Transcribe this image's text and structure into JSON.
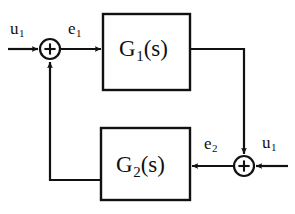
{
  "diagram": {
    "type": "control-block-diagram",
    "colors": {
      "stroke": "#111111",
      "background": "#ffffff",
      "text": "#111111"
    },
    "blocks": [
      {
        "id": "g1",
        "base": "G",
        "subscript": "1",
        "suffix": "(s)",
        "label": "G1(s)",
        "x": 103,
        "y": 14,
        "width": 87,
        "height": 76
      },
      {
        "id": "g2",
        "base": "G",
        "subscript": "2",
        "suffix": "(s)",
        "label": "G2(s)",
        "x": 101,
        "y": 128,
        "width": 89,
        "height": 72
      }
    ],
    "summing_junctions": [
      {
        "id": "sum-left",
        "sign": "+",
        "cx": 50,
        "cy": 49,
        "r": 10,
        "inputs": [
          "u1-left",
          "g2-feedback"
        ],
        "output": "e1"
      },
      {
        "id": "sum-right",
        "sign": "+",
        "cx": 244,
        "cy": 166,
        "r": 10,
        "inputs": [
          "g1-output",
          "u1-right"
        ],
        "output": "e2"
      }
    ],
    "signals": [
      {
        "id": "u1-left",
        "base": "u",
        "subscript": "1",
        "label": "u1"
      },
      {
        "id": "e1",
        "base": "e",
        "subscript": "1",
        "label": "e1"
      },
      {
        "id": "e2",
        "base": "e",
        "subscript": "2",
        "label": "e2"
      },
      {
        "id": "u1-right",
        "base": "u",
        "subscript": "1",
        "label": "u1"
      }
    ]
  }
}
